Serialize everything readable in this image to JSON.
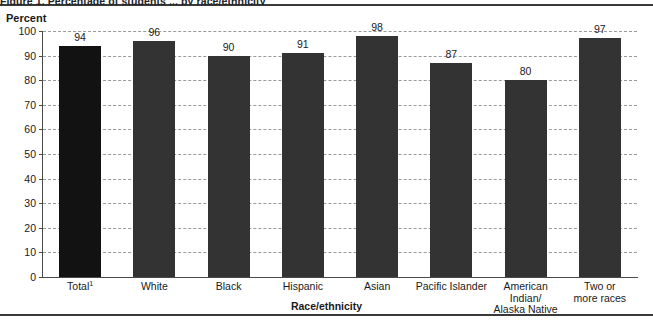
{
  "figure": {
    "title": "Figure 1. Percentage of students ... by race/ethnicity",
    "y_axis_caption": "Percent",
    "x_axis_title": "Race/ethnicity"
  },
  "chart_data": {
    "type": "bar",
    "title": "Figure 1. Percentage of students ... by race/ethnicity",
    "xlabel": "Race/ethnicity",
    "ylabel": "Percent",
    "ylim": [
      0,
      100
    ],
    "ytick_labels": [
      "0",
      "10",
      "20",
      "30",
      "40",
      "50",
      "60",
      "70",
      "80",
      "90",
      "100"
    ],
    "ytick_values": [
      0,
      10,
      20,
      30,
      40,
      50,
      60,
      70,
      80,
      90,
      100
    ],
    "grid": true,
    "grid_style": "dashed",
    "legend": "none",
    "categories": [
      "Total¹",
      "White",
      "Black",
      "Hispanic",
      "Asian",
      "Pacific Islander",
      "American Indian/ Alaska Native",
      "Two or more races"
    ],
    "values": [
      94,
      96,
      90,
      91,
      98,
      87,
      80,
      97
    ],
    "value_labels": [
      "94",
      "96",
      "90",
      "91",
      "98",
      "87",
      "80",
      "97"
    ],
    "bar_colors": [
      "#121212",
      "#333333",
      "#333333",
      "#333333",
      "#333333",
      "#333333",
      "#333333",
      "#333333"
    ],
    "bars": [
      {
        "label_line1": "Total",
        "label_sup": "1",
        "label_line2": "",
        "label_line3": "",
        "value": 94,
        "value_label": "94",
        "color": "#121212"
      },
      {
        "label_line1": "White",
        "label_sup": "",
        "label_line2": "",
        "label_line3": "",
        "value": 96,
        "value_label": "96",
        "color": "#333333"
      },
      {
        "label_line1": "Black",
        "label_sup": "",
        "label_line2": "",
        "label_line3": "",
        "value": 90,
        "value_label": "90",
        "color": "#333333"
      },
      {
        "label_line1": "Hispanic",
        "label_sup": "",
        "label_line2": "",
        "label_line3": "",
        "value": 91,
        "value_label": "91",
        "color": "#333333"
      },
      {
        "label_line1": "Asian",
        "label_sup": "",
        "label_line2": "",
        "label_line3": "",
        "value": 98,
        "value_label": "98",
        "color": "#333333"
      },
      {
        "label_line1": "Pacific Islander",
        "label_sup": "",
        "label_line2": "",
        "label_line3": "",
        "value": 87,
        "value_label": "87",
        "color": "#333333"
      },
      {
        "label_line1": "American",
        "label_sup": "",
        "label_line2": "Indian/",
        "label_line3": "Alaska Native",
        "value": 80,
        "value_label": "80",
        "color": "#333333"
      },
      {
        "label_line1": "Two or",
        "label_sup": "",
        "label_line2": "more races",
        "label_line3": "",
        "value": 97,
        "value_label": "97",
        "color": "#333333"
      }
    ]
  },
  "colors": {
    "bar_total": "#121212",
    "bar_default": "#333333",
    "gridline": "#9a9a9a",
    "axis": "#4a4a4a",
    "rule": "#3a3a3a",
    "text": "#1a1a1a"
  }
}
